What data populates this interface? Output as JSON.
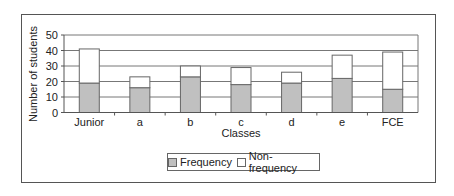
{
  "chart_data": {
    "type": "bar",
    "stacked": true,
    "title": "",
    "xlabel": "Classes",
    "ylabel": "Number of students",
    "ylim": [
      0,
      50
    ],
    "yticks": [
      0,
      10,
      20,
      30,
      40,
      50
    ],
    "grid": true,
    "legend_position": "bottom",
    "categories": [
      "Junior",
      "a",
      "b",
      "c",
      "d",
      "e",
      "FCE"
    ],
    "series": [
      {
        "name": "Frequency",
        "color": "#c0c0c0",
        "values": [
          19,
          16,
          23,
          18,
          19,
          22,
          15
        ]
      },
      {
        "name": "Non-frequency",
        "color": "#ffffff",
        "values": [
          22,
          7,
          7,
          11,
          7,
          15,
          24
        ]
      }
    ]
  },
  "legend": {
    "items": [
      {
        "label": "Frequency",
        "color": "#c0c0c0"
      },
      {
        "label": "Non-frequency",
        "color": "#ffffff"
      }
    ]
  }
}
